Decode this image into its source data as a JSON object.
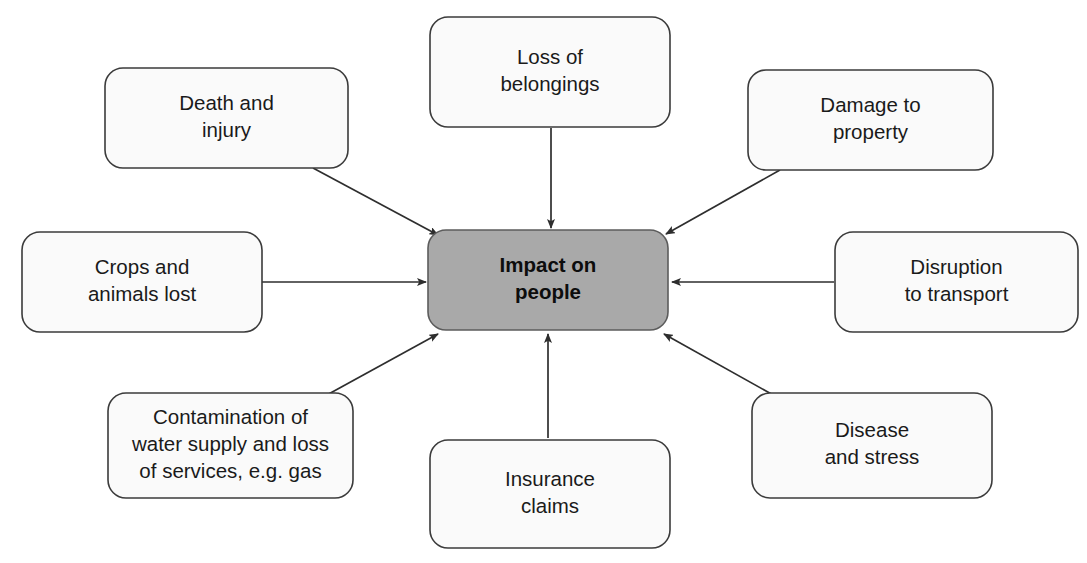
{
  "diagram": {
    "type": "spider-mind-map",
    "title_node": {
      "id": "center",
      "label_lines": [
        "Impact on",
        "people"
      ],
      "fill_color": "#a9a9a9",
      "stroke_color": "#5c5c5c",
      "bold": true,
      "x": 428,
      "y": 230,
      "w": 240,
      "h": 100
    },
    "nodes": [
      {
        "id": "death-and-injury",
        "label_lines": [
          "Death and",
          "injury"
        ],
        "position": "top-left",
        "fill_color": "#fafafa",
        "stroke_color": "#3b3b3b",
        "x": 105,
        "y": 68,
        "w": 243,
        "h": 100
      },
      {
        "id": "loss-of-belongings",
        "label_lines": [
          "Loss of",
          "belongings"
        ],
        "position": "top-center",
        "fill_color": "#fafafa",
        "stroke_color": "#3b3b3b",
        "x": 430,
        "y": 17,
        "w": 240,
        "h": 110
      },
      {
        "id": "damage-to-property",
        "label_lines": [
          "Damage to",
          "property"
        ],
        "position": "top-right",
        "fill_color": "#fafafa",
        "stroke_color": "#3b3b3b",
        "x": 748,
        "y": 70,
        "w": 245,
        "h": 100
      },
      {
        "id": "crops-and-animals-lost",
        "label_lines": [
          "Crops and",
          "animals lost"
        ],
        "position": "middle-left",
        "fill_color": "#fafafa",
        "stroke_color": "#3b3b3b",
        "x": 22,
        "y": 232,
        "w": 240,
        "h": 100
      },
      {
        "id": "disruption-to-transport",
        "label_lines": [
          "Disruption",
          "to transport"
        ],
        "position": "middle-right",
        "fill_color": "#fafafa",
        "stroke_color": "#3b3b3b",
        "x": 835,
        "y": 232,
        "w": 243,
        "h": 100
      },
      {
        "id": "contamination-of-water-supply",
        "label_lines": [
          "Contamination of",
          "water supply and loss",
          "of services, e.g. gas"
        ],
        "position": "bottom-left",
        "fill_color": "#fafafa",
        "stroke_color": "#3b3b3b",
        "x": 108,
        "y": 393,
        "w": 245,
        "h": 105
      },
      {
        "id": "insurance-claims",
        "label_lines": [
          "Insurance",
          "claims"
        ],
        "position": "bottom-center",
        "fill_color": "#fafafa",
        "stroke_color": "#3b3b3b",
        "x": 430,
        "y": 440,
        "w": 240,
        "h": 108
      },
      {
        "id": "disease-and-stress",
        "label_lines": [
          "Disease",
          "and stress"
        ],
        "position": "bottom-right",
        "fill_color": "#fafafa",
        "stroke_color": "#3b3b3b",
        "x": 752,
        "y": 393,
        "w": 240,
        "h": 105
      }
    ],
    "connectors": [
      {
        "id": "arrow-death-and-injury-to-center",
        "from": "death-and-injury",
        "to": "center",
        "direction": "diagonal-down-right",
        "x1": 313,
        "y1": 168,
        "x2": 438,
        "y2": 235
      },
      {
        "id": "arrow-loss-of-belongings-to-center",
        "from": "loss-of-belongings",
        "to": "center",
        "direction": "down",
        "x1": 551,
        "y1": 128,
        "x2": 551,
        "y2": 228
      },
      {
        "id": "arrow-damage-to-property-to-center",
        "from": "damage-to-property",
        "to": "center",
        "direction": "diagonal-down-left",
        "x1": 780,
        "y1": 170,
        "x2": 666,
        "y2": 234
      },
      {
        "id": "arrow-crops-and-animals-lost-to-center",
        "from": "crops-and-animals-lost",
        "to": "center",
        "direction": "right",
        "x1": 262,
        "y1": 282,
        "x2": 426,
        "y2": 282
      },
      {
        "id": "arrow-disruption-to-transport-to-center",
        "from": "disruption-to-transport",
        "to": "center",
        "direction": "left",
        "x1": 834,
        "y1": 282,
        "x2": 672,
        "y2": 282
      },
      {
        "id": "arrow-contamination-to-center",
        "from": "contamination-of-water-supply",
        "to": "center",
        "direction": "diagonal-up-right",
        "x1": 325,
        "y1": 396,
        "x2": 438,
        "y2": 334
      },
      {
        "id": "arrow-insurance-claims-to-center",
        "from": "insurance-claims",
        "to": "center",
        "direction": "up",
        "x1": 548,
        "y1": 438,
        "x2": 548,
        "y2": 334
      },
      {
        "id": "arrow-disease-and-stress-to-center",
        "from": "disease-and-stress",
        "to": "center",
        "direction": "diagonal-up-left",
        "x1": 775,
        "y1": 396,
        "x2": 664,
        "y2": 334
      }
    ]
  }
}
